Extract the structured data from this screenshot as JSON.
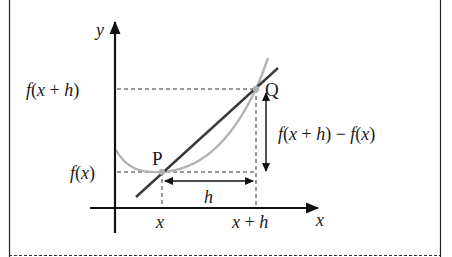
{
  "diagram": {
    "axes": {
      "x_label": "x",
      "y_label": "y"
    },
    "points": {
      "P": {
        "label": "P",
        "x_tick": "x",
        "y_tick": "f(x)"
      },
      "Q": {
        "label": "Q",
        "x_tick": "x + h",
        "y_tick": "f(x + h)"
      }
    },
    "annotations": {
      "horizontal_increment": "h",
      "vertical_increment": "f(x + h) − f(x)"
    },
    "labels": {
      "y_axis": "y",
      "x_axis": "x",
      "fx_plus_h": "f(x + h)",
      "fx": "f(x)",
      "x_tick": "x",
      "x_plus_h_tick": "x + h",
      "h": "h",
      "difference": "f(x + h) − f(x)",
      "P": "P",
      "Q": "Q"
    },
    "colors": {
      "axis": "#111111",
      "secant": "#3a3a3a",
      "curve": "#b4b4b4",
      "point": "#b0b0b0",
      "dashed": "#333333",
      "frame": "#222222"
    }
  }
}
